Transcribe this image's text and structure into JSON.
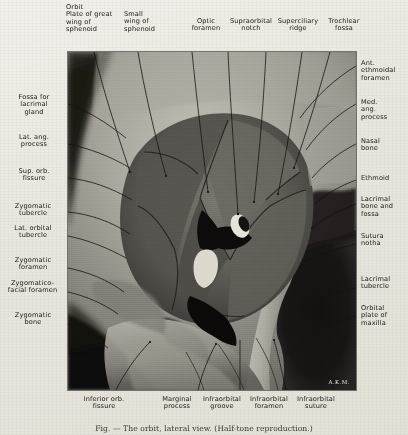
{
  "figure": {
    "title_signature": "A.K.M.",
    "caption": "Fig. — The orbit, lateral view. (Half-tone reproduction.)"
  },
  "labels": {
    "top": [
      {
        "text": "Orbit\nPlate of great\nwing of\nsphenoid",
        "x": 66,
        "y": 4,
        "w": 56,
        "align": "l"
      },
      {
        "text": "Small\nwing of\nsphenoid",
        "x": 124,
        "y": 11,
        "w": 42,
        "align": "l"
      },
      {
        "text": "Optic\nforamen",
        "x": 189,
        "y": 18,
        "w": 36,
        "align": "c"
      },
      {
        "text": "Supraorbital\nnotch",
        "x": 227,
        "y": 18,
        "w": 48,
        "align": "c"
      },
      {
        "text": "Superciliary\nridge",
        "x": 276,
        "y": 18,
        "w": 46,
        "align": "c"
      },
      {
        "text": "Trochlear\nfossa",
        "x": 324,
        "y": 18,
        "w": 42,
        "align": "c"
      }
    ],
    "left": [
      {
        "text": "Fossa for\nlacrimal\ngland",
        "x": 8,
        "y": 95,
        "w": 52
      },
      {
        "text": "Lat. ang.\nprocess",
        "x": 8,
        "y": 135,
        "w": 52
      },
      {
        "text": "Sup. orb.\nfissure",
        "x": 8,
        "y": 168,
        "w": 52
      },
      {
        "text": "Zygomatic\ntubercle",
        "x": 6,
        "y": 203,
        "w": 56
      },
      {
        "text": "Lat. orbital\ntubercle",
        "x": 6,
        "y": 225,
        "w": 56
      },
      {
        "text": "Zygomatic\nforamen",
        "x": 6,
        "y": 256,
        "w": 56
      },
      {
        "text": "Zygomatico-\nfacial foramen",
        "x": 3,
        "y": 279,
        "w": 60
      },
      {
        "text": "Zygomatic\nbone",
        "x": 6,
        "y": 311,
        "w": 56
      }
    ],
    "right": [
      {
        "text": "Ant.\nethmoidal\nforamen",
        "x": 360,
        "y": 61,
        "w": 48
      },
      {
        "text": "Med.\nang.\nprocess",
        "x": 360,
        "y": 100,
        "w": 48
      },
      {
        "text": "Nasal\nbone",
        "x": 360,
        "y": 139,
        "w": 48
      },
      {
        "text": "Ethmoid",
        "x": 360,
        "y": 176,
        "w": 48
      },
      {
        "text": "Lacrimal\nbone and\nfossa",
        "x": 360,
        "y": 196,
        "w": 48
      },
      {
        "text": "Sutura\nnotha",
        "x": 360,
        "y": 233,
        "w": 48
      },
      {
        "text": "Lacrimal\ntubercle",
        "x": 360,
        "y": 275,
        "w": 48
      },
      {
        "text": "Orbital\nplate of\nmaxilla",
        "x": 360,
        "y": 304,
        "w": 48
      }
    ],
    "bottom": [
      {
        "text": "Inferior orb.\nfissure",
        "x": 76,
        "y": 397,
        "w": 56,
        "align": "c"
      },
      {
        "text": "Marginal\nprocess",
        "x": 157,
        "y": 397,
        "w": 42,
        "align": "c"
      },
      {
        "text": "Infraorbital\ngroove",
        "x": 199,
        "y": 397,
        "w": 46,
        "align": "c"
      },
      {
        "text": "Infraorbital\nforamen",
        "x": 246,
        "y": 397,
        "w": 46,
        "align": "c"
      },
      {
        "text": "Infraorbital\nsuture",
        "x": 293,
        "y": 397,
        "w": 46,
        "align": "c"
      }
    ]
  },
  "colors": {
    "paper": "#e9e7e1",
    "ink": "#1b1813",
    "plate_dark": "#151412",
    "plate_mid": "#8d8a84",
    "plate_light": "#d9d6ce"
  }
}
